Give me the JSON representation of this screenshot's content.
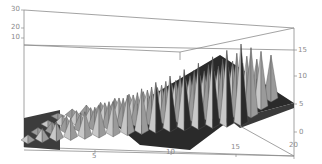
{
  "chart_data": {
    "type": "surface3d",
    "title": "",
    "xlabel": "",
    "ylabel": "",
    "zlabel": "",
    "x_ticks": [
      "5",
      "10",
      "15",
      "20"
    ],
    "x_range": [
      1,
      20
    ],
    "left_axis_ticks": [
      "10",
      "20",
      "30"
    ],
    "right_axis_ticks": [
      "0",
      "5",
      "10",
      "15"
    ],
    "right_axis_range": [
      0,
      18
    ],
    "grid": false,
    "box": true,
    "series": [
      {
        "name": "ridge-peaks",
        "x": [
          1,
          2,
          3,
          4,
          5,
          6,
          7,
          8,
          9,
          10,
          11,
          12,
          13,
          14,
          15,
          16
        ],
        "values": [
          1,
          2,
          3,
          3.5,
          4.5,
          5.5,
          6,
          7,
          8,
          9,
          10,
          11,
          12,
          13,
          14,
          15
        ]
      },
      {
        "name": "front-valleys",
        "x": [
          2,
          4,
          6,
          8,
          10,
          12,
          14,
          15
        ],
        "values": [
          0.5,
          0.5,
          1,
          1,
          0,
          1,
          1,
          0
        ]
      }
    ],
    "colors": {
      "light_face": "#c8c8c8",
      "mid_face": "#9a9a9a",
      "dark_face": "#2a2a2a",
      "frame": "#808080"
    }
  },
  "axes": {
    "left": {
      "labels": [
        "30",
        "20",
        "10"
      ]
    },
    "right": {
      "labels": [
        "15",
        "10",
        "5",
        "0"
      ]
    },
    "bottom": {
      "labels": [
        "5",
        "10",
        "15",
        "20"
      ]
    }
  }
}
